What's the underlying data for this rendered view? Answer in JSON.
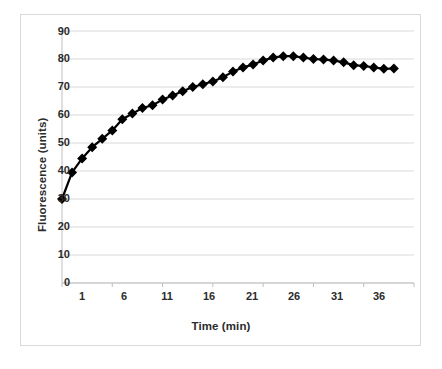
{
  "chart_data": {
    "type": "line",
    "title": "",
    "xlabel": "Time (min)",
    "ylabel": "Fluorescence (units)",
    "xlim": [
      1,
      36
    ],
    "ylim": [
      0,
      90
    ],
    "xticks": [
      1,
      6,
      11,
      16,
      21,
      26,
      31,
      36
    ],
    "yticks": [
      0,
      10,
      20,
      30,
      40,
      50,
      60,
      70,
      80,
      90
    ],
    "grid": "horizontal",
    "legend": "none",
    "marker": "diamond",
    "marker_color": "#000000",
    "line_color": "#000000",
    "grid_color": "#d9d9d9",
    "border_color": "#d9d9d9",
    "background": "#ffffff",
    "x": [
      1,
      2,
      3,
      4,
      5,
      6,
      7,
      8,
      9,
      10,
      11,
      12,
      13,
      14,
      15,
      16,
      17,
      18,
      19,
      20,
      21,
      22,
      23,
      24,
      25,
      26,
      27,
      28,
      29,
      30,
      31,
      32,
      33,
      34
    ],
    "values": [
      30.0,
      39.5,
      44.5,
      48.5,
      51.5,
      54.5,
      58.5,
      60.5,
      62.5,
      63.5,
      65.5,
      67.0,
      68.5,
      70.0,
      71.0,
      72.0,
      73.5,
      75.5,
      77.0,
      78.0,
      79.5,
      80.5,
      81.0,
      81.0,
      80.5,
      80.0,
      79.8,
      79.5,
      78.8,
      77.8,
      77.5,
      77.0,
      76.5,
      76.6
    ],
    "series": [
      {
        "name": "Fluorescence",
        "values": [
          30.0,
          39.5,
          44.5,
          48.5,
          51.5,
          54.5,
          58.5,
          60.5,
          62.5,
          63.5,
          65.5,
          67.0,
          68.5,
          70.0,
          71.0,
          72.0,
          73.5,
          75.5,
          77.0,
          78.0,
          79.5,
          80.5,
          81.0,
          81.0,
          80.5,
          80.0,
          79.8,
          79.5,
          78.8,
          77.8,
          77.5,
          77.0,
          76.5,
          76.6
        ]
      }
    ]
  },
  "axes": {
    "y_title": "Fluorescence (units)",
    "x_title": "Time (min)",
    "y_tick_labels": [
      "90",
      "80",
      "70",
      "60",
      "50",
      "40",
      "30",
      "20",
      "10",
      "0"
    ],
    "x_tick_labels": [
      "1",
      "6",
      "11",
      "16",
      "21",
      "26",
      "31",
      "36"
    ]
  },
  "caption": {
    "text": ""
  }
}
